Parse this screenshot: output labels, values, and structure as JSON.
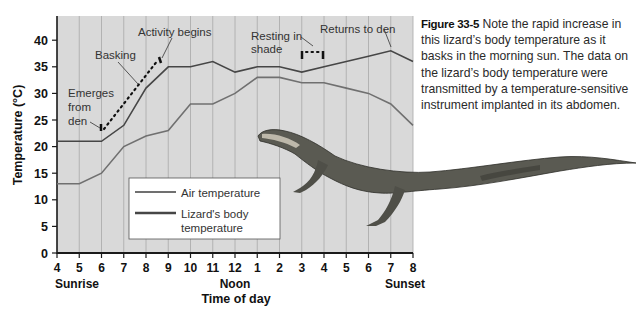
{
  "caption": {
    "figure_label": "Figure 33-5",
    "text": " Note the rapid increase in this lizard’s body temperature as it basks in the morning sun. The data on the lizard’s body temperature were transmitted by a temperature-sensitive instrument implanted in its abdomen."
  },
  "colors": {
    "plot_background": "#d9d9d9",
    "grid": "#a8a8a8",
    "air_line": "#6e6e6e",
    "body_line": "#4a4a4a",
    "axis": "#1a1a1a"
  },
  "chart_data": {
    "type": "line",
    "title": "",
    "xlabel": "Time of day",
    "ylabel": "Temperature (°C)",
    "ylim": [
      0,
      44
    ],
    "yticks": [
      0,
      5,
      10,
      15,
      20,
      25,
      30,
      35,
      40
    ],
    "x_tick_labels": [
      "4",
      "5",
      "6",
      "7",
      "8",
      "9",
      "10",
      "11",
      "12",
      "1",
      "2",
      "3",
      "4",
      "5",
      "6",
      "7",
      "8"
    ],
    "x_sublabels": [
      {
        "at": "4",
        "label": "Sunrise"
      },
      {
        "at": "12",
        "label": "Noon"
      },
      {
        "at": "8",
        "label": "Sunset"
      }
    ],
    "grid": "vertical",
    "legend_position": "lower-left inside",
    "series": [
      {
        "name": "Air temperature",
        "values": [
          13,
          13,
          15,
          20,
          22,
          23,
          28,
          28,
          30,
          33,
          33,
          32,
          32,
          31,
          30,
          28,
          24
        ]
      },
      {
        "name": "Lizard's body temperature",
        "values": [
          21,
          21,
          21,
          24,
          31,
          35,
          35,
          36,
          34,
          35,
          35,
          34,
          35,
          36,
          37,
          38,
          36
        ]
      }
    ],
    "annotations": [
      {
        "label": "Emerges from den",
        "x": "6",
        "y": 23
      },
      {
        "label": "Basking",
        "x": "7.5",
        "y": 31
      },
      {
        "label": "Activity begins",
        "x": "8.7",
        "y": 36.5
      },
      {
        "label": "Resting in shade",
        "x": "3-4",
        "y": 37.5
      },
      {
        "label": "Returns to den",
        "x": "7",
        "y": 38
      }
    ],
    "basking_trace": {
      "from": {
        "x": "6",
        "y": 23
      },
      "to": {
        "x": "8.7",
        "y": 36.5
      },
      "style": "dotted"
    },
    "resting_trace": {
      "from": {
        "x": "3",
        "y": 37.5
      },
      "to": {
        "x": "4",
        "y": 37.5
      },
      "style": "dotted"
    }
  },
  "legend": {
    "air": "Air temperature",
    "body_line1": "Lizard's body",
    "body_line2": "temperature"
  },
  "annotations_text": {
    "emerges": [
      "Emerges",
      "from",
      "den"
    ],
    "basking": "Basking",
    "activity": "Activity begins",
    "resting": [
      "Resting in",
      "shade"
    ],
    "returns": "Returns to den"
  }
}
